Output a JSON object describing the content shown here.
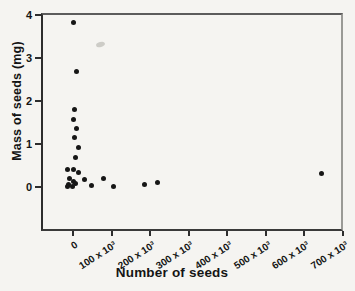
{
  "figure": {
    "background_color": "#f5f4f1",
    "dot_color": "#161616",
    "axis_color": "#2d2d2d",
    "text_color": "#141414"
  },
  "chart_data": {
    "type": "scatter",
    "title": "",
    "xlabel": "Number of seeds",
    "ylabel": "Mass of seeds (mg)",
    "xlim": [
      -83000,
      700000
    ],
    "ylim": [
      -1.02,
      4.05
    ],
    "grid": false,
    "legend": null,
    "x_tick_rotation_deg": -33,
    "x_ticks": [
      {
        "value": 0,
        "label": "0"
      },
      {
        "value": 100000,
        "label": "100 x 10³"
      },
      {
        "value": 200000,
        "label": "200 x 10³"
      },
      {
        "value": 300000,
        "label": "300 x 10³"
      },
      {
        "value": 400000,
        "label": "400 x 10³"
      },
      {
        "value": 500000,
        "label": "500 x 10³"
      },
      {
        "value": 600000,
        "label": "600 x 10³"
      },
      {
        "value": 700000,
        "label": "700 x 10³"
      }
    ],
    "y_ticks": [
      {
        "value": 0,
        "label": "0"
      },
      {
        "value": 1,
        "label": "1"
      },
      {
        "value": 2,
        "label": "2"
      },
      {
        "value": 3,
        "label": "3"
      },
      {
        "value": 4,
        "label": "4"
      }
    ],
    "points": [
      {
        "x": 0,
        "y": 3.82
      },
      {
        "x": 10000,
        "y": 2.7
      },
      {
        "x": 3000,
        "y": 1.8
      },
      {
        "x": 2000,
        "y": 1.57
      },
      {
        "x": 8000,
        "y": 1.36
      },
      {
        "x": 4000,
        "y": 1.16
      },
      {
        "x": 14000,
        "y": 0.92
      },
      {
        "x": 6000,
        "y": 0.7
      },
      {
        "x": -13000,
        "y": 0.4
      },
      {
        "x": 0,
        "y": 0.42
      },
      {
        "x": 15000,
        "y": 0.34
      },
      {
        "x": -8000,
        "y": 0.19
      },
      {
        "x": 1000,
        "y": 0.12
      },
      {
        "x": 6000,
        "y": 0.09
      },
      {
        "x": -11000,
        "y": 0.06
      },
      {
        "x": -2000,
        "y": 0.02
      },
      {
        "x": -15000,
        "y": 0.01
      },
      {
        "x": 30000,
        "y": 0.17
      },
      {
        "x": 49000,
        "y": 0.03
      },
      {
        "x": 80000,
        "y": 0.21
      },
      {
        "x": 106000,
        "y": 0.02
      },
      {
        "x": 185000,
        "y": 0.05
      },
      {
        "x": 220000,
        "y": 0.1
      },
      {
        "x": 645000,
        "y": 0.31
      }
    ]
  }
}
